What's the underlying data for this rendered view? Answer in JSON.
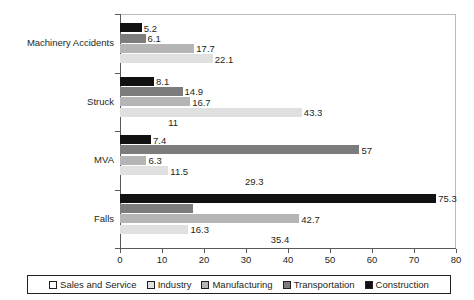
{
  "chart_data": {
    "type": "bar",
    "orientation": "horizontal",
    "title": "",
    "xlabel": "",
    "ylabel": "",
    "xlim": [
      0,
      80
    ],
    "xticks": [
      0,
      10,
      20,
      30,
      40,
      50,
      60,
      70,
      80
    ],
    "xtick_labels": [
      "0",
      "10",
      "20",
      "30",
      "40",
      "50",
      "60",
      "70",
      "80"
    ],
    "grid": false,
    "legend_position": "bottom",
    "categories": [
      "Machinery Accidents",
      "Struck",
      "MVA",
      "Falls"
    ],
    "series": [
      {
        "name": "Sales and Service",
        "color": "#ffffff",
        "values": [
          null,
          11,
          29.3,
          35.4
        ],
        "labels": [
          "",
          "11",
          "29.3",
          "35.4"
        ]
      },
      {
        "name": "Industry",
        "color": "#e0e0e0",
        "values": [
          22.1,
          43.3,
          11.5,
          16.3
        ],
        "labels": [
          "22.1",
          "43.3",
          "11.5",
          "16.3"
        ]
      },
      {
        "name": "Manufacturing",
        "color": "#b5b5b5",
        "values": [
          17.7,
          16.7,
          6.3,
          42.7
        ],
        "labels": [
          "17.7",
          "16.7",
          "6.3",
          "42.7"
        ]
      },
      {
        "name": "Transportation",
        "color": "#7c7c7c",
        "values": [
          6.1,
          14.9,
          57,
          17.3
        ],
        "labels": [
          "6.1",
          "14.9",
          "57",
          ""
        ]
      },
      {
        "name": "Construction",
        "color": "#111111",
        "values": [
          5.2,
          8.1,
          7.4,
          75.3
        ],
        "labels": [
          "5.2",
          "8.1",
          "7.4",
          "75.3"
        ]
      }
    ]
  },
  "legend": {
    "items": [
      {
        "label": "Sales and Service",
        "swatch": "c-sales"
      },
      {
        "label": "Industry",
        "swatch": "c-industry"
      },
      {
        "label": "Manufacturing",
        "swatch": "c-manufacturing"
      },
      {
        "label": "Transportation",
        "swatch": "c-transportation"
      },
      {
        "label": "Construction",
        "swatch": "c-construction"
      }
    ]
  }
}
